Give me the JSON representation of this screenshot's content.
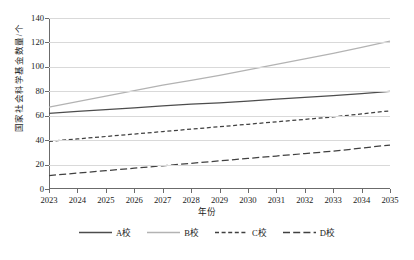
{
  "chart_data": {
    "type": "line",
    "title": "",
    "xlabel": "年份",
    "ylabel": "国家社会科学基金数量/个",
    "x": [
      2023,
      2024,
      2025,
      2026,
      2027,
      2028,
      2029,
      2030,
      2031,
      2032,
      2033,
      2034,
      2035
    ],
    "xtick_labels": [
      "2023",
      "2024",
      "2025",
      "2026",
      "2027",
      "2028",
      "2029",
      "2030",
      "2031",
      "2032",
      "2033",
      "2034",
      "2035"
    ],
    "ytick_labels": [
      "0",
      "20",
      "40",
      "60",
      "80",
      "100",
      "120",
      "140"
    ],
    "yticks": [
      0,
      20,
      40,
      60,
      80,
      100,
      120,
      140
    ],
    "ylim": [
      0,
      140
    ],
    "xlim": [
      2023,
      2035
    ],
    "grid": "horizontal",
    "legend_position": "bottom",
    "series": [
      {
        "name": "A校",
        "color": "#4d4d4d",
        "style": "solid",
        "values": [
          62,
          63.5,
          65,
          66.5,
          68,
          69.5,
          70.5,
          72,
          73.5,
          75,
          76.5,
          78,
          80
        ]
      },
      {
        "name": "B校",
        "color": "#b3b3b3",
        "style": "solid",
        "values": [
          67,
          71.5,
          76,
          80.5,
          85,
          89,
          93,
          97.5,
          102,
          106.5,
          111,
          116,
          121
        ]
      },
      {
        "name": "C校",
        "color": "#404040",
        "style": "dashed-short",
        "values": [
          39,
          41,
          43,
          45,
          47,
          49,
          51,
          53,
          55,
          57,
          59,
          61.5,
          64
        ]
      },
      {
        "name": "D校",
        "color": "#404040",
        "style": "dashed-long",
        "values": [
          11,
          13,
          15,
          17,
          19,
          21,
          23,
          25,
          27,
          29,
          31,
          33.5,
          36
        ]
      }
    ]
  },
  "legend": {
    "items": [
      {
        "label": "A校",
        "icon": "solid-line-swatch"
      },
      {
        "label": "B校",
        "icon": "solid-line-swatch"
      },
      {
        "label": "C校",
        "icon": "short-dashed-line-swatch"
      },
      {
        "label": "D校",
        "icon": "long-dashed-line-swatch"
      }
    ]
  }
}
